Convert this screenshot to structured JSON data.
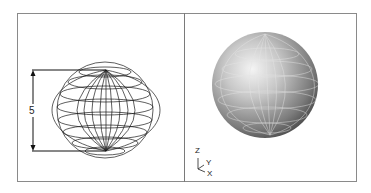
{
  "views": {
    "left": {
      "name": "Wireframe view",
      "style": "wireframe",
      "dimension": {
        "label": "5"
      }
    },
    "right": {
      "name": "Shaded view",
      "style": "gouraud-shaded",
      "ucs_icon": {
        "z": "Z",
        "y": "Y",
        "x": "X"
      }
    }
  },
  "colors": {
    "frame": "#8a8a8a",
    "wire": "#1a1a1a",
    "shade_light": "#f2f2f2",
    "shade_dark": "#3a3a3a"
  }
}
